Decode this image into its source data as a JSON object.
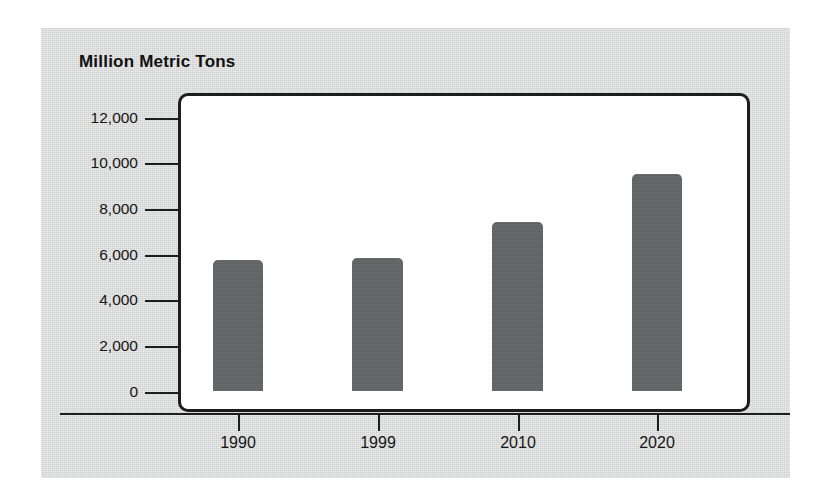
{
  "chart_data": {
    "type": "bar",
    "title": "Million Metric Tons",
    "xlabel": "",
    "ylabel": "Million Metric Tons",
    "categories": [
      "1990",
      "1999",
      "2010",
      "2020"
    ],
    "values": [
      5750,
      5870,
      7420,
      9550
    ],
    "series": [
      {
        "name": "Million Metric Tons",
        "values": [
          5750,
          5870,
          7420,
          9550
        ]
      }
    ],
    "ylim": [
      0,
      12000
    ],
    "yticks": [
      0,
      2000,
      4000,
      6000,
      8000,
      10000,
      12000
    ],
    "ytick_labels": [
      "0",
      "2,000",
      "4,000",
      "6,000",
      "8,000",
      "10,000",
      "12,000"
    ],
    "grid": false,
    "legend": false,
    "legend_position": "none",
    "bar_color": "#636466",
    "plot_background": "#ffffff",
    "panel_background": "#cfd0d0",
    "axis_color": "#1d1d1d"
  }
}
